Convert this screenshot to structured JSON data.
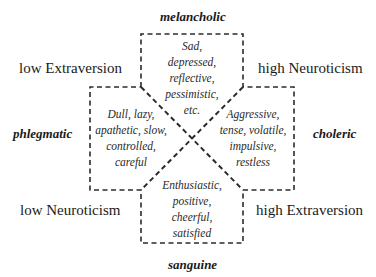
{
  "temperaments": {
    "top": "melancholic",
    "left": "phlegmatic",
    "right": "choleric",
    "bottom": "sanguine"
  },
  "axes": {
    "top_left": "low Extraversion",
    "top_right": "high Neuroticism",
    "bottom_left": "low Neuroticism",
    "bottom_right": "high Extraversion"
  },
  "traits": {
    "melancholic": [
      "Sad,",
      "depressed,",
      "reflective,",
      "pessimistic,",
      "etc."
    ],
    "phlegmatic": [
      "Dull, lazy,",
      "apathetic, slow,",
      "controlled,",
      "careful"
    ],
    "choleric": [
      "Aggressive,",
      "tense, volatile,",
      "impulsive,",
      "restless"
    ],
    "sanguine": [
      "Enthusiastic,",
      "positive,",
      "cheerful,",
      "satisfied"
    ]
  },
  "colors": {
    "line": "#2b2b2b",
    "text": "#1a1a1a",
    "background": "#ffffff"
  }
}
